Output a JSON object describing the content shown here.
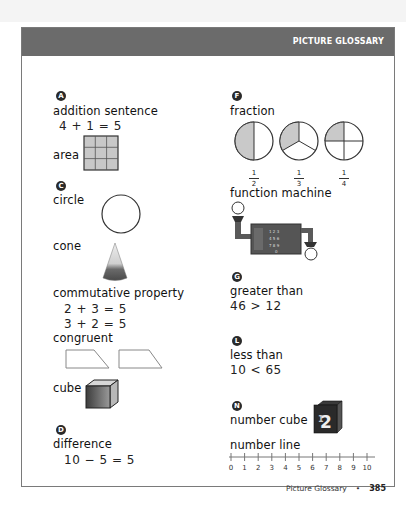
{
  "header": {
    "title": "PICTURE GLOSSARY"
  },
  "sections": {
    "A": {
      "letter": "A"
    },
    "C": {
      "letter": "C"
    },
    "D": {
      "letter": "D"
    },
    "F": {
      "letter": "F"
    },
    "G": {
      "letter": "G"
    },
    "L": {
      "letter": "L"
    },
    "N": {
      "letter": "N"
    }
  },
  "entries": {
    "addition_sentence": {
      "term": "addition sentence",
      "example": "4 + 1 = 5"
    },
    "area": {
      "term": "area",
      "grid": "3x3"
    },
    "circle": {
      "term": "circle"
    },
    "cone": {
      "term": "cone"
    },
    "commutative_property": {
      "term": "commutative property",
      "example1": "2 + 3 = 5",
      "example2": "3 + 2 = 5"
    },
    "congruent": {
      "term": "congruent"
    },
    "cube": {
      "term": "cube"
    },
    "difference": {
      "term": "difference",
      "example": "10 − 5 = 5"
    },
    "fraction": {
      "term": "fraction",
      "fractions": [
        {
          "num": "1",
          "den": "2"
        },
        {
          "num": "1",
          "den": "3"
        },
        {
          "num": "1",
          "den": "4"
        }
      ]
    },
    "function_machine": {
      "term": "function machine"
    },
    "greater_than": {
      "term": "greater than",
      "example": "46 > 12"
    },
    "less_than": {
      "term": "less than",
      "example": "10 < 65"
    },
    "number_cube": {
      "term": "number cube",
      "face_front": "2",
      "face_top": "0",
      "face_side": "1"
    },
    "number_line": {
      "term": "number line",
      "ticks": [
        "0",
        "1",
        "2",
        "3",
        "4",
        "5",
        "6",
        "7",
        "8",
        "9",
        "10"
      ]
    }
  },
  "footer": {
    "label": "Picture Glossary",
    "separator": "•",
    "page_number": "385"
  }
}
